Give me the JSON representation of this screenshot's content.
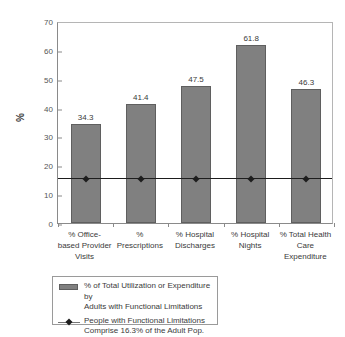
{
  "chart_data": {
    "type": "bar",
    "title": "",
    "subtitle": "",
    "xlabel": "",
    "ylabel": "%",
    "ylim": [
      0,
      70
    ],
    "ytick_step": 10,
    "yticks": [
      "0",
      "10",
      "20",
      "30",
      "40",
      "50",
      "60",
      "70"
    ],
    "grid": false,
    "legend_position": "bottom-left",
    "categories": [
      "% Office-\nbased Provider\nVisits",
      "%\nPrescriptions",
      "% Hospital\nDischarges",
      "% Hospital\nNights",
      "% Total Health\nCare\nExpenditure"
    ],
    "series": [
      {
        "name": "% of Total Utilization or Expenditure by\nAdults with Functional Limitations",
        "type": "bar",
        "color": "#808080",
        "values": [
          34.3,
          41.4,
          47.5,
          61.8,
          46.3
        ],
        "data_labels": [
          "34.3",
          "41.4",
          "47.5",
          "61.8",
          "46.3"
        ]
      },
      {
        "name": "People with Functional Limitations\nComprise 16.3% of the Adult Pop.",
        "type": "line",
        "color": "#1d1d1d",
        "values": [
          16.3,
          16.3,
          16.3,
          16.3,
          16.3
        ],
        "reference_value": 16.3
      }
    ],
    "annotations": []
  },
  "axes": {
    "y_title": "%"
  },
  "legend": {
    "entries": [
      {
        "marker": "bar-swatch-icon",
        "label": "% of Total Utilization or Expenditure by\nAdults with Functional Limitations"
      },
      {
        "marker": "line-diamond-marker-icon",
        "label": "People with Functional Limitations\nComprise 16.3% of the Adult Pop."
      }
    ]
  }
}
